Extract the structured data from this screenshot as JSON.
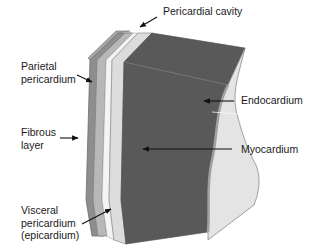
{
  "colors": {
    "background": "#ffffff",
    "myocardium": "#5a5a5a",
    "endocardium": "#e4e4e4",
    "epicardium": "#dcdcdc",
    "parietal": "#b8b8b8",
    "fibrous": "#8e8e8e",
    "cavity": "#ececec",
    "outline": "#8a8a8a",
    "label_text": "#1a1a1a",
    "arrow": "#111111"
  },
  "labels": {
    "pericardial_cavity": "Pericardial cavity",
    "parietal_pericardium": [
      "Parietal",
      "pericardium"
    ],
    "fibrous_layer": [
      "Fibrous",
      "layer"
    ],
    "endocardium": "Endocardium",
    "myocardium": "Myocardium",
    "visceral_pericardium": [
      "Visceral",
      "pericardium",
      "(epicardium)"
    ]
  }
}
